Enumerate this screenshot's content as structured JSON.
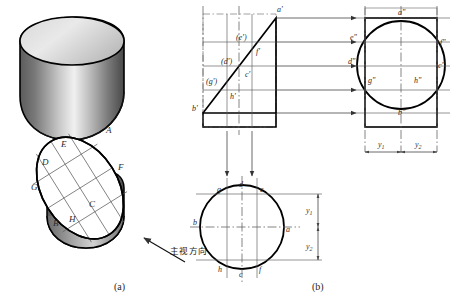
{
  "figure": {
    "title_a": "(a)",
    "title_b": "(b)",
    "direction_label": "主视方向"
  },
  "pictorial": {
    "name": "oblique-cut-cylinder-pictorial",
    "upper_solid_label": "cylinder-truncated-upper",
    "lower_solid_label": "cylinder-truncated-lower",
    "points": [
      {
        "id": "A",
        "label": "A",
        "x": 106,
        "y": 133
      },
      {
        "id": "E",
        "label": "E",
        "x": 61,
        "y": 147
      },
      {
        "id": "D",
        "label": "D",
        "x": 42,
        "y": 165
      },
      {
        "id": "F",
        "label": "F",
        "x": 118,
        "y": 170
      },
      {
        "id": "G",
        "label": "G",
        "x": 31,
        "y": 190
      },
      {
        "id": "C",
        "label": "C",
        "x": 89,
        "y": 207
      },
      {
        "id": "B",
        "label": "B",
        "x": 53,
        "y": 226
      },
      {
        "id": "H",
        "label": "H",
        "x": 69,
        "y": 222
      }
    ]
  },
  "front_view": {
    "name": "front-view-triangle",
    "labels": [
      {
        "id": "a'",
        "label": "a'",
        "x": 277,
        "y": 12
      },
      {
        "id": "(e')",
        "label": "(e')",
        "x": 240,
        "y": 40
      },
      {
        "id": "f'",
        "label": "f'",
        "x": 256,
        "y": 52
      },
      {
        "id": "(d')",
        "label": "(d')",
        "x": 225,
        "y": 64
      },
      {
        "id": "c'",
        "label": "c'",
        "x": 248,
        "y": 76
      },
      {
        "id": "(g')",
        "label": "(g')",
        "x": 211,
        "y": 84
      },
      {
        "id": "h'",
        "label": "h'",
        "x": 233,
        "y": 96
      },
      {
        "id": "b'",
        "label": "b'",
        "x": 196,
        "y": 110
      }
    ]
  },
  "side_view": {
    "name": "side-view-circle",
    "labels": [
      {
        "id": "a\"",
        "label": "a\"",
        "x": 404,
        "y": 14
      },
      {
        "id": "e\"",
        "label": "e\"",
        "x": 352,
        "y": 40
      },
      {
        "id": "f\"",
        "label": "f\"",
        "x": 443,
        "y": 44
      },
      {
        "id": "d\"",
        "label": "d\"",
        "x": 350,
        "y": 62
      },
      {
        "id": "c\"",
        "label": "c\"",
        "x": 440,
        "y": 66
      },
      {
        "id": "g\"",
        "label": "g\"",
        "x": 370,
        "y": 81
      },
      {
        "id": "h\"",
        "label": "h\"",
        "x": 416,
        "y": 81
      },
      {
        "id": "b\"",
        "label": "b\"",
        "x": 404,
        "y": 113
      }
    ],
    "dimensions": [
      {
        "id": "y1",
        "label": "y",
        "sub": "1",
        "x": 378,
        "y": 142
      },
      {
        "id": "y2",
        "label": "y",
        "sub": "2",
        "x": 417,
        "y": 142
      }
    ]
  },
  "top_view": {
    "name": "top-view-circle",
    "labels": [
      {
        "id": "g",
        "label": "g",
        "x": 220,
        "y": 190
      },
      {
        "id": "d",
        "label": "d",
        "x": 243,
        "y": 185
      },
      {
        "id": "e",
        "label": "e",
        "x": 263,
        "y": 190
      },
      {
        "id": "b",
        "label": "b",
        "x": 197,
        "y": 222
      },
      {
        "id": "a",
        "label": "a",
        "x": 287,
        "y": 228
      },
      {
        "id": "h",
        "label": "h",
        "x": 221,
        "y": 270
      },
      {
        "id": "c",
        "label": "c",
        "x": 242,
        "y": 274
      },
      {
        "id": "f",
        "label": "f",
        "x": 262,
        "y": 270
      }
    ],
    "dimensions": [
      {
        "id": "y1",
        "label": "y",
        "sub": "1",
        "x": 312,
        "y": 205
      },
      {
        "id": "y2",
        "label": "y",
        "sub": "2",
        "x": 312,
        "y": 243
      }
    ]
  },
  "colors": {
    "outline": "#000000",
    "thin_line": "#555555",
    "center_line": "#666666",
    "shade_light": "#e8e8e8",
    "shade_mid": "#9a9a9a",
    "shade_dark": "#4a4a4a",
    "background": "#ffffff"
  }
}
